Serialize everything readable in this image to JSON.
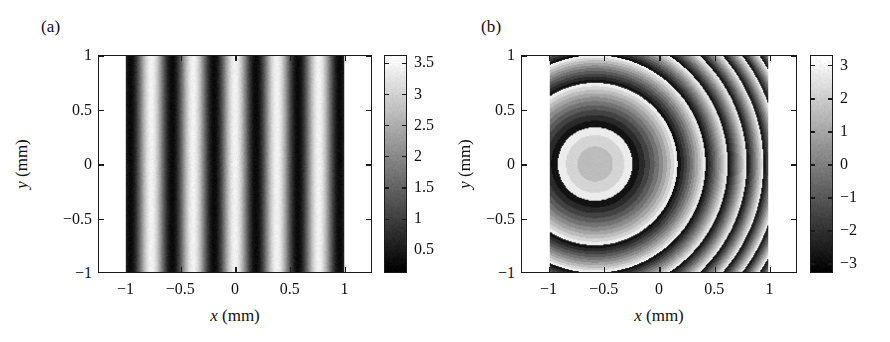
{
  "figure": {
    "width": 890,
    "height": 342,
    "background": "#ffffff",
    "ink": "#1a1a1a"
  },
  "panels": [
    {
      "id": "a",
      "letter": "(a)",
      "axis": {
        "xlabel_var": "x",
        "xlabel_unit": " (mm)",
        "ylabel_var": "y",
        "ylabel_unit": " (mm)",
        "xlim": [
          -1.25,
          1.25
        ],
        "ylim": [
          -1.0,
          1.0
        ],
        "xticks": [
          -1,
          -0.5,
          0,
          0.5,
          1
        ],
        "xticklabels": [
          "−1",
          "−0.5",
          "0",
          "0.5",
          "1"
        ],
        "yticks": [
          -1,
          -0.5,
          0,
          0.5,
          1
        ],
        "yticklabels": [
          "−1",
          "−0.5",
          "0",
          "0.5",
          "1"
        ]
      },
      "colorbar": {
        "vmin": 0.12,
        "vmax": 3.62,
        "ticks": [
          0.5,
          1,
          1.5,
          2,
          2.5,
          3,
          3.5
        ],
        "ticklabels": [
          "0.5",
          "1",
          "1.5",
          "2",
          "2.5",
          "3",
          "3.5"
        ],
        "colormap": "gray"
      }
    },
    {
      "id": "b",
      "letter": "(b)",
      "axis": {
        "xlabel_var": "x",
        "xlabel_unit": " (mm)",
        "ylabel_var": "y",
        "ylabel_unit": " (mm)",
        "xlim": [
          -1.25,
          1.25
        ],
        "ylim": [
          -1.0,
          1.0
        ],
        "xticks": [
          -1,
          -0.5,
          0,
          0.5,
          1
        ],
        "xticklabels": [
          "−1",
          "−0.5",
          "0",
          "0.5",
          "1"
        ],
        "yticks": [
          -1,
          -0.5,
          0,
          0.5,
          1
        ],
        "yticklabels": [
          "−1",
          "−0.5",
          "0",
          "0.5",
          "1"
        ]
      },
      "colorbar": {
        "vmin": -3.3,
        "vmax": 3.3,
        "ticks": [
          -3,
          -2,
          -1,
          0,
          1,
          2,
          3
        ],
        "ticklabels": [
          "−3",
          "−2",
          "−1",
          "0",
          "1",
          "2",
          "3"
        ],
        "colormap": "gray"
      }
    }
  ],
  "chart_data": [
    {
      "type": "heatmap",
      "panel": "a",
      "title": "",
      "xlabel": "x (mm)",
      "ylabel": "y (mm)",
      "xlim": [
        -1.25,
        1.25
      ],
      "ylim": [
        -1.0,
        1.0
      ],
      "zlabel": "intensity (arb. units)",
      "zlim": [
        0.12,
        3.62
      ],
      "colormap": "gray",
      "grid": false,
      "legend": "none",
      "description": "Simulated interferogram: straight vertical sinusoidal fringes inside a circular aperture of radius 1 mm; region outside the aperture is saturated white.",
      "model": {
        "expression": "I(x,y) = a + b*cos(2*pi*f*x + k*(x^2+y^2))",
        "background_a": 1.85,
        "modulation_b": 1.6,
        "carrier_frequency_f": 2.6,
        "carrier_units": "fringes per mm",
        "quadratic_k": 0.0,
        "aperture_radius_mm": 1.0,
        "outside_aperture_value": 3.62,
        "noise_sigma": 0.09
      },
      "fringes_visible": 11,
      "fringe_period_mm": 0.385,
      "x_samples": [
        -1.0,
        -0.75,
        -0.5,
        -0.25,
        0.0,
        0.25,
        0.5,
        0.75,
        1.0
      ],
      "intensity_at_y0": [
        3.44,
        0.31,
        2.55,
        1.33,
        3.45,
        0.28,
        2.6,
        1.3,
        3.42
      ]
    },
    {
      "type": "heatmap",
      "panel": "b",
      "title": "",
      "xlabel": "x (mm)",
      "ylabel": "y (mm)",
      "xlim": [
        -1.25,
        1.25
      ],
      "ylim": [
        -1.0,
        1.0
      ],
      "zlabel": "wrapped phase (rad)",
      "zlim": [
        -3.3,
        3.3
      ],
      "colormap": "gray",
      "grid": false,
      "legend": "none",
      "description": "Wrapped (modulo 2-pi) phase map recovered from the interferogram: a linear carrier in x superposed on a quadratic (spherical) term in r, producing vertical bands crossed by concentric rings, quantised into discrete grey levels.",
      "model": {
        "expression": "phi_w(x,y) = wrap( 2*pi*f*x + k*(x^2+y^2) )",
        "carrier_frequency_f": 2.6,
        "quadratic_k": 14.0,
        "wrap_range_rad": [
          -3.141592653589793,
          3.141592653589793
        ],
        "quantization_levels": 10,
        "aperture_radius_mm": 1.0,
        "outside_aperture_value": 3.3,
        "noise_sigma": 0.12
      },
      "x_samples": [
        -1.0,
        -0.75,
        -0.5,
        -0.25,
        0.0,
        0.25,
        0.5,
        0.75,
        1.0
      ],
      "wrapped_phase_at_y0": [
        2.86,
        -1.88,
        1.05,
        -2.6,
        2.2,
        -0.4,
        2.51,
        -1.03,
        2.86
      ],
      "ring_radii_mm": [
        0.22,
        0.38,
        0.5,
        0.6,
        0.7,
        0.78,
        0.86,
        0.94
      ]
    }
  ]
}
